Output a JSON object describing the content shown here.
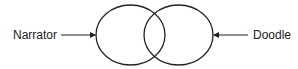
{
  "diagram": {
    "type": "venn",
    "left_label": "Narrator",
    "right_label": "Doodle",
    "stroke_color": "#222222"
  }
}
